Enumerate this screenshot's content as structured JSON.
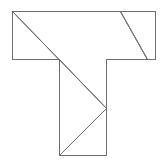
{
  "diagram": {
    "type": "tangram-t-shape",
    "canvas": {
      "width": 162,
      "height": 163
    },
    "stroke_color": "#6e6e6e",
    "background": "#ffffff",
    "outline": [
      [
        12,
        11
      ],
      [
        155,
        11
      ],
      [
        155,
        59
      ],
      [
        106,
        59
      ],
      [
        106,
        155
      ],
      [
        59,
        155
      ],
      [
        59,
        59
      ],
      [
        12,
        59
      ]
    ],
    "pieces": [
      {
        "name": "left-triangle",
        "points": [
          [
            12,
            11
          ],
          [
            12,
            59
          ],
          [
            59,
            59
          ]
        ]
      },
      {
        "name": "large-quad",
        "points": [
          [
            12,
            11
          ],
          [
            120,
            11
          ],
          [
            147,
            59
          ],
          [
            106,
            59
          ],
          [
            106,
            108
          ]
        ]
      },
      {
        "name": "right-trapezoid",
        "points": [
          [
            120,
            11
          ],
          [
            155,
            11
          ],
          [
            155,
            59
          ],
          [
            147,
            59
          ]
        ]
      },
      {
        "name": "stem-left-triangle",
        "points": [
          [
            59,
            59
          ],
          [
            106,
            108
          ],
          [
            59,
            155
          ]
        ]
      },
      {
        "name": "stem-right-triangle",
        "points": [
          [
            106,
            108
          ],
          [
            106,
            155
          ],
          [
            59,
            155
          ]
        ]
      }
    ],
    "lines": [
      {
        "name": "main-diagonal",
        "from": [
          12,
          11
        ],
        "to": [
          106,
          108
        ]
      },
      {
        "name": "stem-diagonal",
        "from": [
          106,
          108
        ],
        "to": [
          59,
          155
        ]
      },
      {
        "name": "top-right-diagonal",
        "from": [
          120,
          11
        ],
        "to": [
          147,
          59
        ]
      }
    ]
  }
}
